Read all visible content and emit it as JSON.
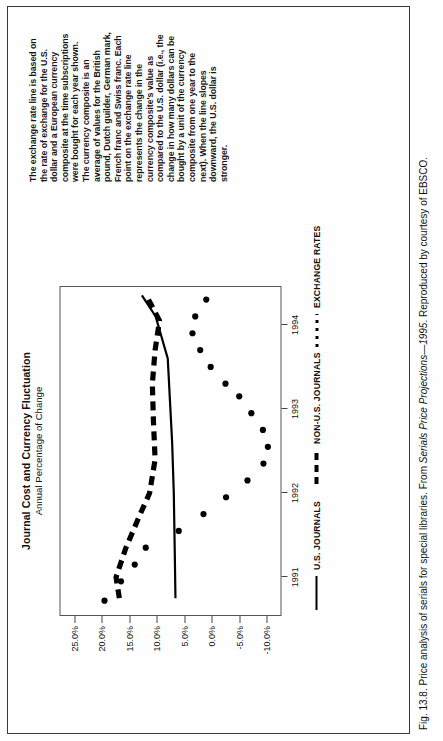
{
  "figure": {
    "caption_prefix": "Fig. 13.8.",
    "caption_text_1": "Price analysis of serials for special libraries. From",
    "caption_italic": "Serials Price Projections—1995",
    "caption_text_2": ". Reproduced by courtesy of EBSCO."
  },
  "chart": {
    "title": "Journal Cost and Currency Fluctuation",
    "subtitle": "Annual Percentage of Change"
  },
  "note": {
    "text": "The exchange rate line is based on the rate of exchange for the U.S. dollar and a European currency composite at the time subscriptions were bought for each year shown. The currency composite is an average of values for the British pound, Dutch guilder, German mark, French franc and Swiss franc. Each point on the exchange rate line represents the change in the currency composite's value as compared to the U.S. dollar (i.e., the change in how many dollars can be bought by a unit of the currency composite from one year to the next). When the line slopes downward, the U.S. dollar is stronger."
  },
  "legend": {
    "items": [
      {
        "label": "U.S. JOURNALS",
        "style": "solid"
      },
      {
        "label": "NON-U.S. JOURNALS",
        "style": "dashed"
      },
      {
        "label": "EXCHANGE RATES",
        "style": "dotted"
      }
    ]
  },
  "chart_data": {
    "type": "line",
    "title": "Journal Cost and Currency Fluctuation",
    "subtitle": "Annual Percentage of Change",
    "xlabel": "",
    "ylabel": "",
    "x": [
      1991,
      1992,
      1993,
      1994
    ],
    "xticklabels": [
      "1991",
      "1992",
      "1993",
      "1994"
    ],
    "yticklabels": [
      "25.0%",
      "20.0%",
      "15.0%",
      "10.0%",
      "5.0%",
      "0.0%",
      "-5.0%",
      "-10.0%"
    ],
    "ytickvalues": [
      25.0,
      20.0,
      15.0,
      10.0,
      5.0,
      0.0,
      -5.0,
      -10.0
    ],
    "ylim": [
      -12.5,
      27.5
    ],
    "xlim": [
      1990.55,
      1994.45
    ],
    "grid": false,
    "legend_position": "below",
    "series": [
      {
        "name": "U.S. JOURNALS",
        "style": "solid",
        "x": [
          1990.75,
          1991.2,
          1992.0,
          1992.6,
          1993.1,
          1993.6,
          1994.1,
          1994.35
        ],
        "values": [
          6.6,
          6.7,
          6.9,
          7.2,
          7.6,
          8.0,
          10.2,
          12.7
        ]
      },
      {
        "name": "NON-U.S. JOURNALS",
        "style": "dashed",
        "x": [
          1990.75,
          1991.0,
          1991.35,
          1991.75,
          1992.0,
          1992.4,
          1992.85,
          1993.3,
          1993.7,
          1994.05,
          1994.35
        ],
        "values": [
          16.8,
          17.4,
          15.6,
          13.0,
          11.3,
          10.3,
          10.6,
          10.8,
          10.3,
          9.5,
          11.9
        ]
      },
      {
        "name": "EXCHANGE RATES",
        "style": "dotted",
        "x": [
          1990.72,
          1990.95,
          1991.15,
          1991.35,
          1991.55,
          1991.75,
          1991.95,
          1992.15,
          1992.35,
          1992.55,
          1992.75,
          1992.95,
          1993.15,
          1993.3,
          1993.5,
          1993.7,
          1993.9,
          1994.1,
          1994.3
        ],
        "values": [
          19.5,
          16.5,
          14.0,
          12.0,
          6.0,
          1.5,
          -2.6,
          -6.5,
          -9.4,
          -10.2,
          -9.3,
          -7.2,
          -5.0,
          -2.5,
          0.2,
          2.1,
          3.5,
          3.0,
          1.0
        ]
      }
    ]
  }
}
